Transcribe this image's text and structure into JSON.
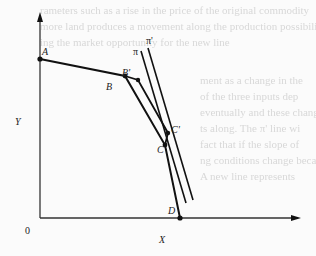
{
  "figure": {
    "axes": {
      "y_label": "Y",
      "x_label": "X",
      "origin_label": "0"
    },
    "points": {
      "A": "A",
      "B": "B",
      "B_prime": "B'",
      "C": "C",
      "C_prime": "C'",
      "D": "D"
    },
    "lines": {
      "pi": "π",
      "pi_prime": "π'"
    },
    "colors": {
      "ink": "#111111",
      "axis": "#333333",
      "background": "#fbfbfb",
      "bleed_text": "#d8d8d8"
    }
  },
  "bleed_through": {
    "top_lines": [
      "rameters such as a rise in the price of the original commodity",
      "more land produces a movement along the production possibility curve",
      "ing the market opportunity for the new line"
    ],
    "right_lines": [
      "ment as a change in the",
      "of the three inputs dep",
      "eventually and these change",
      "ts along. The π' line wi",
      "fact that if the slope of",
      "ng conditions change because",
      "A new line represents"
    ]
  }
}
